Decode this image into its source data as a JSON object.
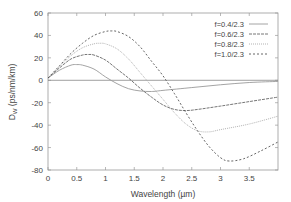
{
  "chart_data": {
    "type": "line",
    "title": "",
    "xlabel": "Wavelength (µm)",
    "ylabel": "D_W (ps/nm/km)",
    "ylabel_main": "D",
    "ylabel_sub": "W",
    "ylabel_rest": " (ps/nm/km)",
    "xlim": [
      0,
      4.0
    ],
    "ylim": [
      -80,
      60
    ],
    "xticks": [
      0,
      0.5,
      1,
      1.5,
      2,
      2.5,
      3,
      3.5
    ],
    "xtick_labels": [
      "0",
      "0.5",
      "1",
      "1.5",
      "2",
      "2.5",
      "3",
      "3.5"
    ],
    "yticks": [
      -80,
      -60,
      -40,
      -20,
      0,
      20,
      40,
      60
    ],
    "ytick_labels": [
      "-80",
      "-60",
      "-40",
      "-20",
      "0",
      "20",
      "40",
      "60"
    ],
    "grid": false,
    "legend_position": "upper right",
    "zero_line": true,
    "series": [
      {
        "name": "f=0.4/2.3",
        "dash": "",
        "color": "#9a9a9a",
        "x": [
          0,
          0.2,
          0.4,
          0.5,
          0.6,
          0.8,
          1.0,
          1.2,
          1.4,
          1.6,
          1.8,
          2.0,
          2.5,
          3.0,
          3.5,
          4.0
        ],
        "y": [
          2,
          9,
          13.5,
          14,
          13.5,
          10,
          3,
          -3,
          -7.5,
          -9.5,
          -10,
          -9,
          -6.5,
          -4,
          -2,
          -1
        ]
      },
      {
        "name": "f=0.6/2.3",
        "dash": "3,1",
        "color": "#666666",
        "x": [
          0,
          0.2,
          0.4,
          0.6,
          0.7,
          0.8,
          1.0,
          1.2,
          1.4,
          1.6,
          1.8,
          2.0,
          2.2,
          2.4,
          2.6,
          3.0,
          3.5,
          4.0
        ],
        "y": [
          2,
          11,
          19,
          22.5,
          23,
          22.5,
          18,
          10,
          2,
          -7,
          -15,
          -22,
          -26,
          -27,
          -26,
          -23,
          -19,
          -15
        ]
      },
      {
        "name": "f=0.8/2.3",
        "dash": "1,1",
        "color": "#aaaaaa",
        "x": [
          0,
          0.2,
          0.4,
          0.6,
          0.8,
          0.9,
          1.0,
          1.2,
          1.4,
          1.6,
          1.8,
          2.0,
          2.2,
          2.4,
          2.6,
          2.8,
          3.0,
          3.5,
          4.0
        ],
        "y": [
          2,
          12,
          22,
          29,
          32.5,
          33,
          32.5,
          28,
          19,
          7,
          -5,
          -17,
          -29,
          -39,
          -45,
          -46,
          -44,
          -39,
          -32
        ]
      },
      {
        "name": "f=1.0/2.3",
        "dash": "2,2",
        "color": "#555555",
        "x": [
          0,
          0.2,
          0.4,
          0.6,
          0.8,
          1.0,
          1.1,
          1.2,
          1.4,
          1.6,
          1.8,
          2.0,
          2.2,
          2.4,
          2.6,
          2.8,
          3.0,
          3.15,
          3.4,
          3.7,
          4.0
        ],
        "y": [
          2,
          13,
          24,
          33,
          40,
          43.5,
          44,
          43.5,
          39,
          30,
          17,
          4,
          -12,
          -29,
          -45,
          -59,
          -69,
          -72,
          -70,
          -63,
          -55
        ]
      }
    ]
  }
}
